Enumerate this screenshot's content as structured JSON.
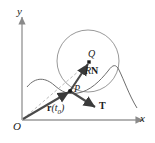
{
  "figure": {
    "kind": "math-diagram",
    "background": "#ffffff",
    "stroke_color": "#6e6e6e",
    "vector_color": "#3a3a3a",
    "label_color": "#1a1a1a",
    "width": 155,
    "height": 143
  },
  "axes": {
    "x_label": "x",
    "y_label": "y",
    "origin_label": "O",
    "x_axis": {
      "x1": 22,
      "y1": 120,
      "x2": 146,
      "y2": 120
    },
    "y_axis": {
      "x1": 22,
      "y1": 120,
      "x2": 22,
      "y2": 14
    }
  },
  "points": [
    {
      "name": "P",
      "label": "P",
      "x": 70,
      "y": 91,
      "dot": true
    },
    {
      "name": "Q",
      "label": "Q",
      "x": 89,
      "y": 62,
      "dot": true
    },
    {
      "name": "O",
      "label": "O",
      "x": 22,
      "y": 120,
      "dot": false
    }
  ],
  "circle": {
    "name": "osculating-circle",
    "cx": 88,
    "cy": 61,
    "r": 31
  },
  "vectors": [
    {
      "name": "position-vector",
      "label_r": "r",
      "label_paren_open": "(",
      "label_t": "t",
      "label_sub": "0",
      "label_paren_close": ")",
      "label_full": "r(t0)",
      "from": [
        22,
        120
      ],
      "to": [
        70,
        91
      ]
    },
    {
      "name": "radius-normal-vector",
      "label_r": "R",
      "label_n": "N",
      "label_full": "RN",
      "from": [
        70,
        91
      ],
      "to": [
        89,
        62
      ]
    },
    {
      "name": "tangent-vector",
      "label_full": "T",
      "from": [
        70,
        91
      ],
      "to": [
        97,
        109
      ]
    }
  ],
  "dashed_line": {
    "name": "center-ray",
    "from": [
      22,
      120
    ],
    "to": [
      89,
      62
    ]
  },
  "curve": {
    "name": "space-curve",
    "path": "M 27,87 C 36,76 46,78 54,85 C 62,92 68,95 78,93 C 90,91 100,81 108,71 C 113,64 116,64 119,70 C 124,80 129,95 137,108"
  }
}
